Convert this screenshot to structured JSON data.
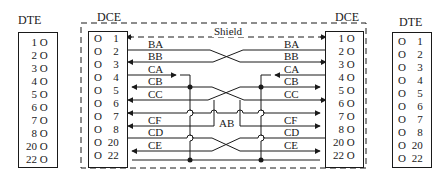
{
  "left_dte": {
    "title": "DTE",
    "pins": [
      "1",
      "2",
      "3",
      "4",
      "5",
      "6",
      "7",
      "8",
      "20",
      "22"
    ],
    "contact_glyph": "O"
  },
  "left_dce": {
    "title": "DCE",
    "pins": [
      "1",
      "2",
      "3",
      "4",
      "5",
      "6",
      "7",
      "8",
      "20",
      "22"
    ],
    "contact_glyph": "O"
  },
  "right_dce": {
    "title": "DCE",
    "pins": [
      "1",
      "2",
      "3",
      "4",
      "5",
      "6",
      "7",
      "8",
      "20",
      "22"
    ],
    "contact_glyph": "O"
  },
  "right_dte": {
    "title": "DTE",
    "pins": [
      "1",
      "2",
      "3",
      "4",
      "5",
      "6",
      "7",
      "8",
      "20",
      "22"
    ],
    "contact_glyph": "O"
  },
  "shield": {
    "label": "Shield"
  },
  "signals_left": [
    "BA",
    "BB",
    "CA",
    "CB",
    "CC",
    "CF",
    "CD",
    "CE"
  ],
  "signals_right": [
    "BA",
    "BB",
    "CA",
    "CB",
    "CC",
    "CF",
    "CD",
    "CE"
  ],
  "ground_label": "AB",
  "colors": {
    "ink": "#1a1a1a",
    "background": "#ffffff"
  }
}
